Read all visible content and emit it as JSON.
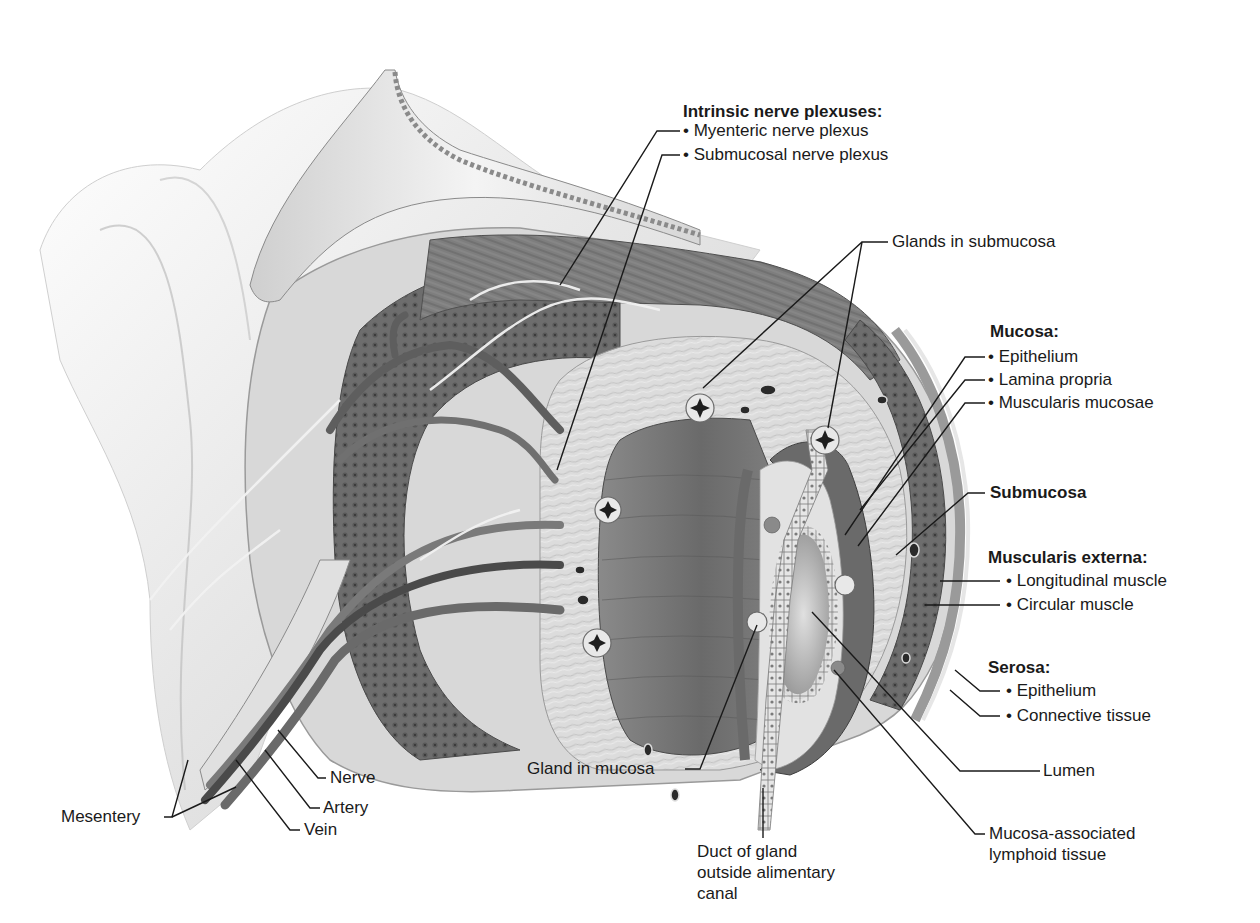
{
  "diagram": {
    "colors": {
      "background": "#ffffff",
      "text": "#1a1a1a",
      "leader_line": "#1a1a1a",
      "serosa": "#d9d9d9",
      "muscle_dark": "#6e6e6e",
      "muscle_mid": "#8c8c8c",
      "submucosa": "#cfcfcf",
      "mucosa_epithelium": "#7a7a7a",
      "lumen": "#b3b3b3",
      "mesentery": "#ececec",
      "vessel": "#5a5a5a"
    }
  },
  "labels": {
    "intrinsic_nerve_plexuses": {
      "heading": "Intrinsic nerve plexuses:",
      "items": [
        "• Myenteric nerve plexus",
        "• Submucosal nerve plexus"
      ]
    },
    "glands_in_submucosa": "Glands in submucosa",
    "mucosa": {
      "heading": "Mucosa:",
      "items": [
        "• Epithelium",
        "• Lamina propria",
        "• Muscularis mucosae"
      ]
    },
    "submucosa": "Submucosa",
    "muscularis_externa": {
      "heading": "Muscularis externa:",
      "items": [
        "• Longitudinal muscle",
        "• Circular muscle"
      ]
    },
    "serosa": {
      "heading": "Serosa:",
      "items": [
        "• Epithelium",
        "• Connective tissue"
      ]
    },
    "lumen": "Lumen",
    "malt": [
      "Mucosa-associated",
      "lymphoid tissue"
    ],
    "duct_of_gland": [
      "Duct of gland",
      "outside alimentary",
      "canal"
    ],
    "gland_in_mucosa": "Gland in mucosa",
    "nerve": "Nerve",
    "artery": "Artery",
    "vein": "Vein",
    "mesentery": "Mesentery"
  }
}
